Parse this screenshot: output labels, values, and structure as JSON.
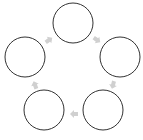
{
  "diagram": {
    "type": "cycle",
    "node_count": 5,
    "nodes": [
      {
        "id": "node-top",
        "cx": 73,
        "cy": 23,
        "r": 20,
        "label": ""
      },
      {
        "id": "node-right",
        "cx": 120,
        "cy": 57,
        "r": 20,
        "label": ""
      },
      {
        "id": "node-bottom-right",
        "cx": 103,
        "cy": 110,
        "r": 20,
        "label": ""
      },
      {
        "id": "node-bottom-left",
        "cx": 44,
        "cy": 110,
        "r": 20,
        "label": ""
      },
      {
        "id": "node-left",
        "cx": 25,
        "cy": 57,
        "r": 20,
        "label": ""
      }
    ],
    "arrows": [
      {
        "from": "node-top",
        "to": "node-right",
        "x": 97,
        "y": 40,
        "angle": 35
      },
      {
        "from": "node-right",
        "to": "node-bottom-right",
        "x": 113,
        "y": 85,
        "angle": 105
      },
      {
        "from": "node-bottom-right",
        "to": "node-bottom-left",
        "x": 74,
        "y": 114,
        "angle": 180
      },
      {
        "from": "node-bottom-left",
        "to": "node-left",
        "x": 35,
        "y": 85,
        "angle": 250
      },
      {
        "from": "node-left",
        "to": "node-top",
        "x": 49,
        "y": 40,
        "angle": 325
      }
    ],
    "colors": {
      "circle_stroke": "#333333",
      "arrow_fill": "#d0d0d0",
      "background": "#ffffff"
    }
  }
}
